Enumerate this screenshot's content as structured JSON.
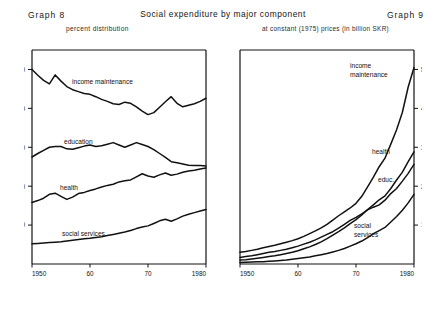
{
  "header": {
    "graph_left_label": "Graph 8",
    "graph_right_label": "Graph 9",
    "title": "Social expenditure by major component",
    "subtitle_left": "percent distribution",
    "subtitle_right": "at constant (1975) prices (in billion SKR)"
  },
  "series_labels": {
    "income_maintenance": "income maintenance",
    "education": "education",
    "health": "health",
    "social_services": "social services",
    "income_maintenance_line1": "income",
    "income_maintenance_line2": "maintenance",
    "health_short": "health",
    "education_short": "educ.",
    "social_services_line1": "social",
    "social_services_line2": "services"
  },
  "colors": {
    "ink": "#111111",
    "axis": "#111111",
    "background": "#ffffff"
  },
  "chart_data": [
    {
      "id": "graph8",
      "type": "line",
      "title": "Graph 8",
      "subtitle": "percent distribution",
      "xlabel": "",
      "ylabel": "",
      "xlim": [
        1950,
        1980
      ],
      "ylim": [
        0,
        55
      ],
      "yticks": [
        10,
        20,
        30,
        40,
        50
      ],
      "xticks": [
        1950,
        1960,
        1970,
        1980
      ],
      "xticklabels": [
        "1950",
        "60",
        "70",
        "1980"
      ],
      "grid": false,
      "legend": "inline-labels",
      "x": [
        1950,
        1951,
        1952,
        1953,
        1954,
        1955,
        1956,
        1957,
        1958,
        1959,
        1960,
        1961,
        1962,
        1963,
        1964,
        1965,
        1966,
        1967,
        1968,
        1969,
        1970,
        1971,
        1972,
        1973,
        1974,
        1975,
        1976,
        1977,
        1978,
        1979,
        1980
      ],
      "series": [
        {
          "name": "income maintenance",
          "values": [
            50.0,
            48.5,
            47.2,
            46.3,
            48.6,
            47.0,
            45.6,
            44.8,
            44.3,
            43.8,
            43.6,
            43.0,
            42.3,
            41.8,
            41.2,
            41.0,
            41.6,
            41.3,
            40.4,
            39.3,
            38.4,
            38.9,
            40.3,
            41.7,
            43.0,
            41.3,
            40.4,
            40.8,
            41.2,
            41.8,
            42.6
          ]
        },
        {
          "name": "education",
          "values": [
            27.5,
            28.4,
            29.2,
            30.0,
            30.2,
            30.2,
            29.6,
            29.5,
            29.9,
            30.3,
            30.6,
            30.2,
            30.4,
            30.8,
            31.2,
            30.6,
            30.0,
            30.6,
            31.2,
            30.7,
            30.2,
            29.4,
            28.4,
            27.4,
            26.3,
            26.0,
            25.7,
            25.4,
            25.3,
            25.3,
            25.2
          ]
        },
        {
          "name": "health",
          "values": [
            15.8,
            16.3,
            16.9,
            17.9,
            18.2,
            17.4,
            16.6,
            17.2,
            18.1,
            18.4,
            18.9,
            19.3,
            19.8,
            20.2,
            20.5,
            21.1,
            21.4,
            21.6,
            22.4,
            23.2,
            22.6,
            22.3,
            22.9,
            23.4,
            22.8,
            23.1,
            23.6,
            23.9,
            24.1,
            24.4,
            24.7
          ]
        },
        {
          "name": "social services",
          "values": [
            5.2,
            5.3,
            5.4,
            5.5,
            5.6,
            5.7,
            5.9,
            6.1,
            6.3,
            6.5,
            6.6,
            6.8,
            7.0,
            7.3,
            7.6,
            7.9,
            8.2,
            8.6,
            9.1,
            9.5,
            9.8,
            10.4,
            11.1,
            11.5,
            11.0,
            11.6,
            12.3,
            12.8,
            13.2,
            13.6,
            14.0
          ]
        }
      ]
    },
    {
      "id": "graph9",
      "type": "line",
      "title": "Graph 9",
      "subtitle": "at constant (1975) prices (in billion SKR)",
      "xlabel": "",
      "ylabel": "billion SKR",
      "xlim": [
        1950,
        1980
      ],
      "ylim": [
        0,
        55
      ],
      "yticks": [
        10,
        20,
        30,
        40,
        50
      ],
      "xticks": [
        1950,
        1960,
        1970,
        1980
      ],
      "xticklabels": [
        "1950",
        "60",
        "70",
        "1980"
      ],
      "grid": false,
      "legend": "inline-labels",
      "yaxis_position": "right",
      "x": [
        1950,
        1951,
        1952,
        1953,
        1954,
        1955,
        1956,
        1957,
        1958,
        1959,
        1960,
        1961,
        1962,
        1963,
        1964,
        1965,
        1966,
        1967,
        1968,
        1969,
        1970,
        1971,
        1972,
        1973,
        1974,
        1975,
        1976,
        1977,
        1978,
        1979,
        1980
      ],
      "series": [
        {
          "name": "income maintenance",
          "values": [
            3.0,
            3.2,
            3.5,
            3.8,
            4.2,
            4.5,
            4.8,
            5.2,
            5.6,
            6.0,
            6.5,
            7.1,
            7.8,
            8.5,
            9.3,
            10.2,
            11.3,
            12.4,
            13.4,
            14.4,
            15.6,
            17.4,
            19.8,
            22.3,
            25.0,
            27.2,
            30.8,
            34.5,
            39.0,
            45.5,
            50.5
          ]
        },
        {
          "name": "health",
          "values": [
            1.0,
            1.1,
            1.3,
            1.5,
            1.7,
            1.9,
            2.1,
            2.4,
            2.7,
            3.0,
            3.4,
            3.9,
            4.4,
            5.0,
            5.7,
            6.5,
            7.4,
            8.3,
            9.3,
            10.4,
            11.4,
            12.6,
            14.0,
            15.2,
            16.5,
            17.5,
            19.4,
            21.6,
            23.6,
            26.3,
            28.8
          ]
        },
        {
          "name": "educ.",
          "values": [
            1.7,
            1.9,
            2.1,
            2.4,
            2.7,
            3.0,
            3.2,
            3.5,
            3.8,
            4.2,
            4.6,
            5.1,
            5.6,
            6.2,
            6.9,
            7.6,
            8.3,
            9.2,
            10.2,
            11.2,
            12.0,
            12.9,
            13.9,
            14.6,
            15.2,
            16.4,
            18.1,
            19.4,
            21.3,
            23.3,
            25.6
          ]
        },
        {
          "name": "social services",
          "values": [
            0.4,
            0.45,
            0.5,
            0.55,
            0.6,
            0.7,
            0.8,
            0.9,
            1.0,
            1.2,
            1.4,
            1.6,
            1.8,
            2.1,
            2.4,
            2.7,
            3.1,
            3.5,
            4.0,
            4.6,
            5.2,
            5.9,
            6.8,
            7.8,
            8.6,
            9.4,
            10.8,
            12.2,
            13.8,
            15.7,
            17.9
          ]
        }
      ]
    }
  ]
}
